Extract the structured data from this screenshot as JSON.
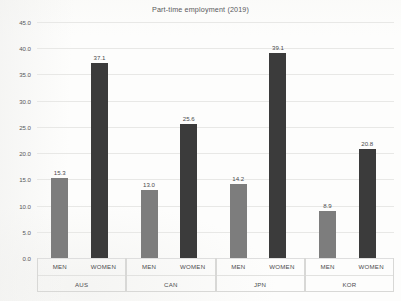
{
  "chart_data": {
    "type": "bar",
    "title": "Part-time employment (2019)",
    "xlabel": "",
    "ylabel": "",
    "ylim": [
      0.0,
      45.0
    ],
    "ytick_step": 5.0,
    "ytick_labels": [
      "0.0",
      "5.0",
      "10.0",
      "15.0",
      "20.0",
      "25.0",
      "30.0",
      "35.0",
      "40.0",
      "45.0"
    ],
    "grid": true,
    "legend": "none",
    "categories": [
      "AUS",
      "CAN",
      "JPN",
      "KOR"
    ],
    "subcategories": [
      "MEN",
      "WOMEN"
    ],
    "series": [
      {
        "name": "MEN",
        "values": [
          15.3,
          13.0,
          14.2,
          8.9
        ],
        "color": "#7d7d7d"
      },
      {
        "name": "WOMEN",
        "values": [
          37.1,
          25.6,
          39.1,
          20.8
        ],
        "color": "#3b3b3b"
      }
    ],
    "bars": [
      {
        "group": "AUS",
        "sub": "MEN",
        "value": 15.3,
        "label": "15.3",
        "series": "men"
      },
      {
        "group": "AUS",
        "sub": "WOMEN",
        "value": 37.1,
        "label": "37.1",
        "series": "women"
      },
      {
        "group": "CAN",
        "sub": "MEN",
        "value": 13.0,
        "label": "13.0",
        "series": "men"
      },
      {
        "group": "CAN",
        "sub": "WOMEN",
        "value": 25.6,
        "label": "25.6",
        "series": "women"
      },
      {
        "group": "JPN",
        "sub": "MEN",
        "value": 14.2,
        "label": "14.2",
        "series": "men"
      },
      {
        "group": "JPN",
        "sub": "WOMEN",
        "value": 39.1,
        "label": "39.1",
        "series": "women"
      },
      {
        "group": "KOR",
        "sub": "MEN",
        "value": 8.9,
        "label": "8.9",
        "series": "men"
      },
      {
        "group": "KOR",
        "sub": "WOMEN",
        "value": 20.8,
        "label": "20.8",
        "series": "women"
      }
    ]
  }
}
